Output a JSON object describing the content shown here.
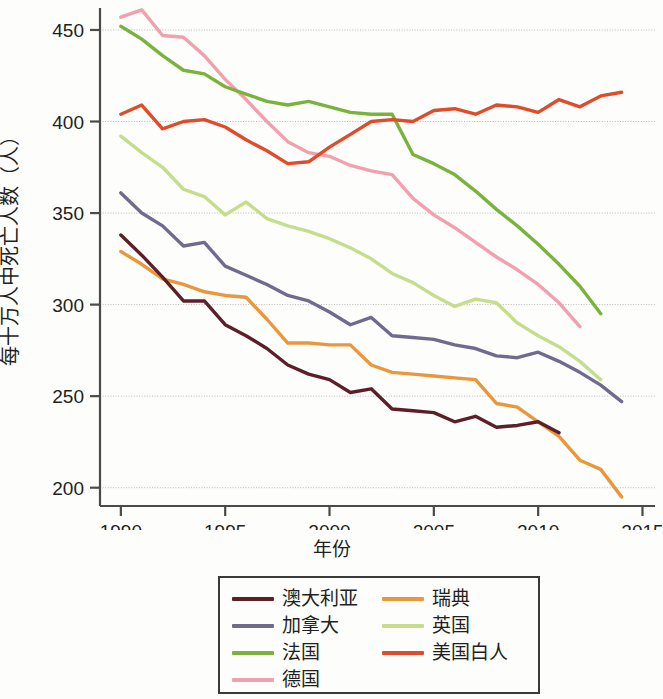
{
  "chart_data": {
    "type": "line",
    "title": "",
    "xlabel": "年份",
    "ylabel": "每十万人中死亡人数（人）",
    "xlim": [
      1989,
      2015.6
    ],
    "ylim": [
      190,
      462
    ],
    "xticks": [
      1990,
      1995,
      2000,
      2005,
      2010,
      2015
    ],
    "yticks": [
      200,
      250,
      300,
      350,
      400,
      450
    ],
    "grid": "horizontal",
    "legend_position": "below-center",
    "series": [
      {
        "name": "澳大利亚",
        "color": "#5c1f28",
        "x": [
          1990,
          1991,
          1992,
          1993,
          1994,
          1995,
          1996,
          1997,
          1998,
          1999,
          2000,
          2001,
          2002,
          2003,
          2004,
          2005,
          2006,
          2007,
          2008,
          2009,
          2010,
          2011
        ],
        "values": [
          338,
          327,
          315,
          302,
          302,
          289,
          283,
          276,
          267,
          262,
          259,
          252,
          254,
          243,
          242,
          241,
          236,
          239,
          233,
          234,
          236,
          230
        ]
      },
      {
        "name": "加拿大",
        "color": "#6e6b8e",
        "x": [
          1990,
          1991,
          1992,
          1993,
          1994,
          1995,
          1996,
          1997,
          1998,
          1999,
          2000,
          2001,
          2002,
          2003,
          2004,
          2005,
          2006,
          2007,
          2008,
          2009,
          2010,
          2011,
          2012,
          2013,
          2014
        ],
        "values": [
          361,
          350,
          343,
          332,
          334,
          321,
          316,
          311,
          305,
          302,
          296,
          289,
          293,
          283,
          282,
          281,
          278,
          276,
          272,
          271,
          274,
          269,
          263,
          256,
          247
        ]
      },
      {
        "name": "法国",
        "color": "#79b33e",
        "x": [
          1990,
          1991,
          1992,
          1993,
          1994,
          1995,
          1996,
          1997,
          1998,
          1999,
          2000,
          2001,
          2002,
          2003,
          2004,
          2005,
          2006,
          2007,
          2008,
          2009,
          2010,
          2011,
          2012,
          2013
        ],
        "values": [
          452,
          445,
          436,
          428,
          426,
          419,
          415,
          411,
          409,
          411,
          408,
          405,
          404,
          404,
          382,
          377,
          371,
          362,
          352,
          343,
          333,
          322,
          310,
          295
        ]
      },
      {
        "name": "德国",
        "color": "#f1a0ad",
        "x": [
          1990,
          1991,
          1992,
          1993,
          1994,
          1995,
          1996,
          1997,
          1998,
          1999,
          2000,
          2001,
          2002,
          2003,
          2004,
          2005,
          2006,
          2007,
          2008,
          2009,
          2010,
          2011,
          2012
        ],
        "values": [
          457,
          461,
          447,
          446,
          436,
          423,
          412,
          400,
          389,
          383,
          381,
          376,
          373,
          371,
          358,
          349,
          342,
          334,
          326,
          319,
          311,
          301,
          288
        ]
      },
      {
        "name": "瑞典",
        "color": "#e8973c",
        "x": [
          1990,
          1991,
          1992,
          1993,
          1994,
          1995,
          1996,
          1997,
          1998,
          1999,
          2000,
          2001,
          2002,
          2003,
          2004,
          2005,
          2006,
          2007,
          2008,
          2009,
          2010,
          2011,
          2012,
          2013,
          2014
        ],
        "values": [
          329,
          322,
          314,
          311,
          307,
          305,
          304,
          292,
          279,
          279,
          278,
          278,
          267,
          263,
          262,
          261,
          260,
          259,
          246,
          244,
          236,
          228,
          215,
          210,
          195
        ]
      },
      {
        "name": "英国",
        "color": "#c5de8e",
        "x": [
          1990,
          1991,
          1992,
          1993,
          1994,
          1995,
          1996,
          1997,
          1998,
          1999,
          2000,
          2001,
          2002,
          2003,
          2004,
          2005,
          2006,
          2007,
          2008,
          2009,
          2010,
          2011,
          2012,
          2013
        ],
        "values": [
          392,
          383,
          375,
          363,
          359,
          349,
          356,
          347,
          343,
          340,
          336,
          331,
          325,
          317,
          312,
          305,
          299,
          303,
          301,
          290,
          283,
          277,
          269,
          259
        ]
      },
      {
        "name": "美国白人",
        "color": "#e04b2a",
        "x": [
          1990,
          1991,
          1992,
          1993,
          1994,
          1995,
          1996,
          1997,
          1998,
          1999,
          2000,
          2001,
          2002,
          2003,
          2004,
          2005,
          2006,
          2007,
          2008,
          2009,
          2010,
          2011,
          2012,
          2013,
          2014
        ],
        "values": [
          404,
          409,
          396,
          400,
          401,
          397,
          390,
          384,
          377,
          378,
          386,
          393,
          400,
          401,
          400,
          406,
          407,
          404,
          409,
          408,
          405,
          412,
          408,
          414,
          416
        ]
      }
    ]
  },
  "axis": {
    "ylabel": "每十万人中死亡人数（人）",
    "xlabel": "年份",
    "xticks": [
      "1990",
      "1995",
      "2000",
      "2005",
      "2010",
      "2015"
    ],
    "yticks": [
      "450",
      "400",
      "350",
      "300",
      "250",
      "200"
    ]
  },
  "legend": {
    "items": [
      {
        "label": "澳大利亚",
        "color": "#5c1f28"
      },
      {
        "label": "瑞典",
        "color": "#e8973c"
      },
      {
        "label": "加拿大",
        "color": "#6e6b8e"
      },
      {
        "label": "英国",
        "color": "#c5de8e"
      },
      {
        "label": "法国",
        "color": "#79b33e"
      },
      {
        "label": "美国白人",
        "color": "#e04b2a"
      },
      {
        "label": "德国",
        "color": "#f1a0ad"
      },
      {
        "label": "",
        "color": ""
      }
    ]
  }
}
